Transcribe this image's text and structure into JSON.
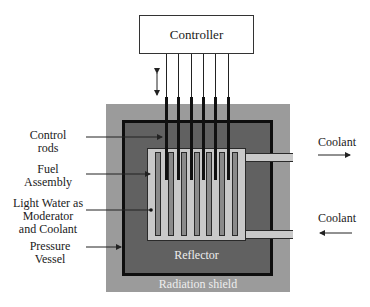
{
  "diagram": {
    "controller": {
      "label": "Controller"
    },
    "labels": {
      "control_rods": [
        "Control",
        "rods"
      ],
      "fuel_assembly": [
        "Fuel",
        "Assembly"
      ],
      "light_water": [
        "Light Water as",
        "Moderator",
        "and Coolant"
      ],
      "pressure_vessel": [
        "Pressure",
        "Vessel"
      ],
      "coolant_out": "Coolant",
      "coolant_in": "Coolant",
      "reflector": "Reflector",
      "radiation_shield": "Radiation shield"
    },
    "control_rod_count": 6,
    "fuel_element_count": 7,
    "colors": {
      "radiation_shield": "#9b9b9b",
      "moderator": "#616161",
      "pressure_vessel_wall": "#0e0e0e",
      "reflector": "#c9c9c9",
      "fuel": "#8a8a8a",
      "control_rod": "#111111"
    }
  }
}
